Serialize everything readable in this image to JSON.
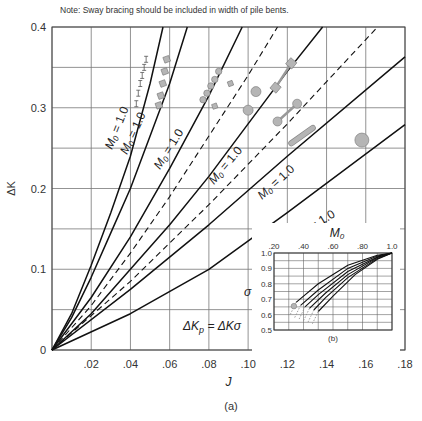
{
  "note": "Note:  Sway bracing should be included in width of pile bents.",
  "caption": "(a)",
  "inset_caption": "(b)",
  "formula": "ΔKₚ = ΔKσ",
  "chart_data": [
    {
      "type": "line",
      "title": "",
      "xlabel": "J",
      "ylabel": "ΔK",
      "xlim": [
        0,
        0.18
      ],
      "ylim": [
        0,
        0.4
      ],
      "x_ticks": [
        "0",
        ".02",
        ".04",
        ".06",
        ".08",
        ".10",
        ".12",
        ".14",
        ".16",
        ".18"
      ],
      "y_ticks": [
        "0",
        "0.1",
        "0.2",
        "0.3",
        "0.4"
      ],
      "grid": true,
      "grid_y_step": 0.05,
      "grid_x_step": 0.02,
      "curve_label": "M₀ = 1.0",
      "series": [
        {
          "name": "M0 = 1.0 (curve 1)",
          "style": "solid",
          "labeled": true,
          "x": [
            0,
            0.01,
            0.02,
            0.03,
            0.04,
            0.05,
            0.0566
          ],
          "y": [
            0,
            0.045,
            0.105,
            0.17,
            0.24,
            0.33,
            0.4
          ]
        },
        {
          "name": "M0 = 1.0 (curve 2)",
          "style": "solid",
          "labeled": true,
          "x": [
            0,
            0.01,
            0.02,
            0.03,
            0.04,
            0.05,
            0.06,
            0.069
          ],
          "y": [
            0,
            0.04,
            0.09,
            0.145,
            0.2,
            0.265,
            0.33,
            0.4
          ]
        },
        {
          "name": "curve 3",
          "style": "solid",
          "labeled": true,
          "x": [
            0,
            0.02,
            0.04,
            0.06,
            0.08,
            0.097
          ],
          "y": [
            0,
            0.065,
            0.14,
            0.225,
            0.315,
            0.4
          ]
        },
        {
          "name": "dashed 1",
          "style": "dashed",
          "labeled": false,
          "x": [
            0,
            0.02,
            0.04,
            0.06,
            0.08,
            0.1,
            0.115
          ],
          "y": [
            0,
            0.055,
            0.12,
            0.19,
            0.265,
            0.34,
            0.4
          ]
        },
        {
          "name": "curve 4",
          "style": "solid",
          "labeled": true,
          "x": [
            0,
            0.02,
            0.04,
            0.06,
            0.08,
            0.1,
            0.12,
            0.138
          ],
          "y": [
            0,
            0.045,
            0.1,
            0.155,
            0.215,
            0.28,
            0.345,
            0.4
          ]
        },
        {
          "name": "dashed 2",
          "style": "dashed",
          "labeled": false,
          "x": [
            0,
            0.04,
            0.08,
            0.12,
            0.166
          ],
          "y": [
            0,
            0.085,
            0.18,
            0.28,
            0.4
          ]
        },
        {
          "name": "curve 5",
          "style": "solid",
          "labeled": true,
          "x": [
            0,
            0.04,
            0.08,
            0.12,
            0.18
          ],
          "y": [
            0,
            0.075,
            0.155,
            0.24,
            0.363
          ]
        },
        {
          "name": "curve 6 (bottom)",
          "style": "solid",
          "labeled": true,
          "x": [
            0,
            0.04,
            0.08,
            0.12,
            0.18
          ],
          "y": [
            0,
            0.045,
            0.1,
            0.17,
            0.279
          ]
        }
      ],
      "markers": [
        {
          "shape": "tick-bar",
          "points": [
            [
              0.048,
              0.36
            ],
            [
              0.047,
              0.35
            ],
            [
              0.046,
              0.34
            ],
            [
              0.045,
              0.33
            ],
            [
              0.044,
              0.318
            ],
            [
              0.043,
              0.305
            ]
          ]
        },
        {
          "shape": "square",
          "points": [
            [
              0.0585,
              0.36
            ],
            [
              0.0575,
              0.345
            ],
            [
              0.0565,
              0.33
            ],
            [
              0.0555,
              0.315
            ],
            [
              0.0545,
              0.303
            ]
          ]
        },
        {
          "shape": "circle-small",
          "points": [
            [
              0.085,
              0.345
            ],
            [
              0.083,
              0.335
            ],
            [
              0.081,
              0.327
            ],
            [
              0.079,
              0.318
            ],
            [
              0.077,
              0.31
            ]
          ]
        },
        {
          "shape": "square-small",
          "points": [
            [
              0.091,
              0.33
            ],
            [
              0.083,
              0.302
            ]
          ]
        },
        {
          "shape": "square-bar",
          "points": [
            [
              0.114,
              0.325
            ],
            [
              0.122,
              0.355
            ]
          ]
        },
        {
          "shape": "circle",
          "points": [
            [
              0.1,
              0.297
            ],
            [
              0.104,
              0.32
            ]
          ]
        },
        {
          "shape": "circle-bar",
          "points": [
            [
              0.115,
              0.283
            ],
            [
              0.125,
              0.305
            ]
          ]
        },
        {
          "shape": "capsule",
          "points": [
            [
              0.122,
              0.256
            ],
            [
              0.133,
              0.275
            ]
          ]
        },
        {
          "shape": "circle-large",
          "points": [
            [
              0.158,
              0.26
            ]
          ]
        }
      ],
      "annotation": "ΔKₚ = ΔKσ"
    },
    {
      "type": "line",
      "title": "",
      "xlabel": "M₀",
      "ylabel": "σ",
      "xlim": [
        0.2,
        1.0
      ],
      "ylim": [
        0.5,
        1.0
      ],
      "x_ticks": [
        ".20",
        ".40",
        ".60",
        ".80",
        "1.0"
      ],
      "y_ticks": [
        "1.0",
        "0.9",
        "0.8",
        "0.7",
        "0.6",
        "0.5"
      ],
      "grid": true,
      "series": [
        {
          "name": "s1",
          "x": [
            0.35,
            0.5,
            0.7,
            0.9,
            1.0
          ],
          "y": [
            0.68,
            0.8,
            0.92,
            0.985,
            1.0
          ]
        },
        {
          "name": "s2",
          "x": [
            0.38,
            0.5,
            0.7,
            0.9,
            1.0
          ],
          "y": [
            0.66,
            0.76,
            0.9,
            0.98,
            1.0
          ]
        },
        {
          "name": "s3",
          "x": [
            0.41,
            0.5,
            0.7,
            0.9,
            1.0
          ],
          "y": [
            0.65,
            0.73,
            0.88,
            0.975,
            1.0
          ]
        },
        {
          "name": "s4",
          "x": [
            0.44,
            0.55,
            0.7,
            0.9,
            1.0
          ],
          "y": [
            0.64,
            0.74,
            0.86,
            0.97,
            1.0
          ]
        },
        {
          "name": "s5",
          "x": [
            0.47,
            0.55,
            0.7,
            0.9,
            1.0
          ],
          "y": [
            0.63,
            0.71,
            0.84,
            0.965,
            1.0
          ]
        },
        {
          "name": "s6",
          "x": [
            0.5,
            0.6,
            0.75,
            0.9,
            1.0
          ],
          "y": [
            0.62,
            0.72,
            0.86,
            0.96,
            1.0
          ]
        }
      ],
      "caption": "(b)"
    }
  ]
}
